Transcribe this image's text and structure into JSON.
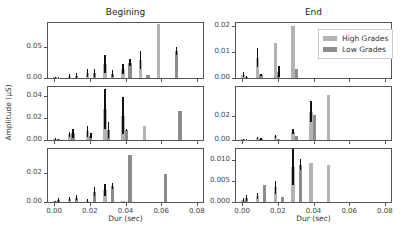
{
  "chart_data": {
    "type": "bar",
    "layout": "3x2 grid of subplots, shared x-axis",
    "column_titles": [
      "Begining",
      "End"
    ],
    "xlabel": "Dur (sec)",
    "ylabel": "Amplitude (µS)",
    "xticks": [
      "0.00",
      "0.02",
      "0.04",
      "0.06",
      "0.08"
    ],
    "xlim": [
      -0.004,
      0.084
    ],
    "legend": {
      "entries": [
        "High Grades",
        "Low Grades"
      ],
      "position": "upper right of top-right panel"
    },
    "colors": {
      "High Grades": "#b3b3b3",
      "Low Grades": "#8c8c8c",
      "error": "#111111"
    },
    "panels": [
      {
        "row": 0,
        "col": 0,
        "ylim": [
          0,
          0.09
        ],
        "yticks": [
          "0.00",
          "0.05"
        ],
        "ytick_values": [
          0,
          0.05
        ],
        "bars": [
          {
            "x": 0.0,
            "series": "High Grades",
            "y": 0.001,
            "err": 0.001
          },
          {
            "x": 0.002,
            "series": "Low Grades",
            "y": 0.0005,
            "err": 0.001
          },
          {
            "x": 0.008,
            "series": "High Grades",
            "y": 0.003,
            "err": 0.004
          },
          {
            "x": 0.012,
            "series": "Low Grades",
            "y": 0.004,
            "err": 0.004
          },
          {
            "x": 0.018,
            "series": "High Grades",
            "y": 0.008,
            "err": 0.007
          },
          {
            "x": 0.022,
            "series": "Low Grades",
            "y": 0.008,
            "err": 0.006
          },
          {
            "x": 0.028,
            "series": "High Grades",
            "y": 0.023,
            "err": 0.014
          },
          {
            "x": 0.032,
            "series": "Low Grades",
            "y": 0.007,
            "err": 0.006
          },
          {
            "x": 0.038,
            "series": "High Grades",
            "y": 0.015,
            "err": 0.008
          },
          {
            "x": 0.042,
            "series": "Low Grades",
            "y": 0.025,
            "err": 0.006
          },
          {
            "x": 0.048,
            "series": "High Grades",
            "y": 0.03,
            "err": 0.015
          },
          {
            "x": 0.052,
            "series": "Low Grades",
            "y": 0.005,
            "err": 0
          },
          {
            "x": 0.058,
            "series": "High Grades",
            "y": 0.088,
            "err": 0
          },
          {
            "x": 0.068,
            "series": "Low Grades",
            "y": 0.044,
            "err": 0.006
          }
        ]
      },
      {
        "row": 0,
        "col": 1,
        "ylim": [
          0,
          0.021
        ],
        "yticks": [
          "0.00",
          "0.01",
          "0.02"
        ],
        "ytick_values": [
          0,
          0.01,
          0.02
        ],
        "bars": [
          {
            "x": 0.0,
            "series": "High Grades",
            "y": 0.0012,
            "err": 0.001
          },
          {
            "x": 0.002,
            "series": "Low Grades",
            "y": 0.0004,
            "err": 0.0003
          },
          {
            "x": 0.008,
            "series": "High Grades",
            "y": 0.0078,
            "err": 0.0037
          },
          {
            "x": 0.01,
            "series": "Low Grades",
            "y": 0.0011,
            "err": 0.0004
          },
          {
            "x": 0.018,
            "series": "High Grades",
            "y": 0.0135,
            "err": 0
          },
          {
            "x": 0.02,
            "series": "Low Grades",
            "y": 0.0024,
            "err": 0.002
          },
          {
            "x": 0.028,
            "series": "High Grades",
            "y": 0.02,
            "err": 0
          },
          {
            "x": 0.03,
            "series": "Low Grades",
            "y": 0.0033,
            "err": 0
          }
        ]
      },
      {
        "row": 1,
        "col": 0,
        "ylim": [
          0,
          0.048
        ],
        "yticks": [
          "0.00",
          "0.02",
          "0.04"
        ],
        "ytick_values": [
          0,
          0.02,
          0.04
        ],
        "bars": [
          {
            "x": 0.0,
            "series": "High Grades",
            "y": 0.001,
            "err": 0.001
          },
          {
            "x": 0.002,
            "series": "Low Grades",
            "y": 0.0005,
            "err": 0.0005
          },
          {
            "x": 0.008,
            "series": "High Grades",
            "y": 0.005,
            "err": 0.002
          },
          {
            "x": 0.01,
            "series": "Low Grades",
            "y": 0.006,
            "err": 0.004
          },
          {
            "x": 0.018,
            "series": "High Grades",
            "y": 0.008,
            "err": 0.005
          },
          {
            "x": 0.02,
            "series": "Low Grades",
            "y": 0.004,
            "err": 0.002
          },
          {
            "x": 0.028,
            "series": "High Grades",
            "y": 0.028,
            "err": 0.018
          },
          {
            "x": 0.03,
            "series": "Low Grades",
            "y": 0.009,
            "err": 0.007
          },
          {
            "x": 0.038,
            "series": "High Grades",
            "y": 0.022,
            "err": 0.017
          },
          {
            "x": 0.04,
            "series": "Low Grades",
            "y": 0.009,
            "err": 0.001
          },
          {
            "x": 0.05,
            "series": "High Grades",
            "y": 0.013,
            "err": 0
          },
          {
            "x": 0.07,
            "series": "Low Grades",
            "y": 0.026,
            "err": 0
          }
        ]
      },
      {
        "row": 1,
        "col": 1,
        "ylim": [
          0,
          0.045
        ],
        "yticks": [
          "0.00",
          "0.02"
        ],
        "ytick_values": [
          0,
          0.02
        ],
        "bars": [
          {
            "x": 0.0,
            "series": "High Grades",
            "y": 0.0005,
            "err": 0.0005
          },
          {
            "x": 0.002,
            "series": "Low Grades",
            "y": 0.0003,
            "err": 0.0003
          },
          {
            "x": 0.008,
            "series": "High Grades",
            "y": 0.0015,
            "err": 0.001
          },
          {
            "x": 0.01,
            "series": "Low Grades",
            "y": 0.0012,
            "err": 0.0008
          },
          {
            "x": 0.018,
            "series": "High Grades",
            "y": 0.003,
            "err": 0.0015
          },
          {
            "x": 0.02,
            "series": "Low Grades",
            "y": 0.001,
            "err": 0
          },
          {
            "x": 0.028,
            "series": "High Grades",
            "y": 0.007,
            "err": 0.002
          },
          {
            "x": 0.03,
            "series": "Low Grades",
            "y": 0.0035,
            "err": 0
          },
          {
            "x": 0.038,
            "series": "High Grades",
            "y": 0.024,
            "err": 0.009
          },
          {
            "x": 0.04,
            "series": "Low Grades",
            "y": 0.021,
            "err": 0
          },
          {
            "x": 0.048,
            "series": "High Grades",
            "y": 0.038,
            "err": 0
          }
        ]
      },
      {
        "row": 2,
        "col": 0,
        "ylim": [
          0,
          0.036
        ],
        "yticks": [
          "0.00",
          "0.02"
        ],
        "ytick_values": [
          0,
          0.02
        ],
        "bars": [
          {
            "x": 0.0,
            "series": "High Grades",
            "y": 0.0005,
            "err": 0.0005
          },
          {
            "x": 0.002,
            "series": "Low Grades",
            "y": 0.0015,
            "err": 0.0015
          },
          {
            "x": 0.008,
            "series": "High Grades",
            "y": 0.002,
            "err": 0.0012
          },
          {
            "x": 0.012,
            "series": "Low Grades",
            "y": 0.003,
            "err": 0.0015
          },
          {
            "x": 0.018,
            "series": "High Grades",
            "y": 0.001,
            "err": 0.001
          },
          {
            "x": 0.022,
            "series": "Low Grades",
            "y": 0.007,
            "err": 0.003
          },
          {
            "x": 0.028,
            "series": "High Grades",
            "y": 0.008,
            "err": 0.004
          },
          {
            "x": 0.032,
            "series": "Low Grades",
            "y": 0.011,
            "err": 0.002
          },
          {
            "x": 0.038,
            "series": "High Grades",
            "y": 0.001,
            "err": 0
          },
          {
            "x": 0.042,
            "series": "Low Grades",
            "y": 0.032,
            "err": 0
          },
          {
            "x": 0.062,
            "series": "Low Grades",
            "y": 0.019,
            "err": 0
          }
        ]
      },
      {
        "row": 2,
        "col": 1,
        "ylim": [
          0,
          0.0125
        ],
        "yticks": [
          "0.000",
          "0.005",
          "0.010"
        ],
        "ytick_values": [
          0,
          0.005,
          0.01
        ],
        "bars": [
          {
            "x": 0.0,
            "series": "High Grades",
            "y": 0.0005,
            "err": 0.0004
          },
          {
            "x": 0.002,
            "series": "Low Grades",
            "y": 0.001,
            "err": 0.0007
          },
          {
            "x": 0.008,
            "series": "High Grades",
            "y": 0.0015,
            "err": 0.0007
          },
          {
            "x": 0.012,
            "series": "Low Grades",
            "y": 0.0039,
            "err": 0
          },
          {
            "x": 0.018,
            "series": "High Grades",
            "y": 0.0035,
            "err": 0.0015
          },
          {
            "x": 0.022,
            "series": "Low Grades",
            "y": 0.0013,
            "err": 0
          },
          {
            "x": 0.028,
            "series": "High Grades",
            "y": 0.0083,
            "err": 0.0042
          },
          {
            "x": 0.032,
            "series": "Low Grades",
            "y": 0.0088,
            "err": 0.0013
          },
          {
            "x": 0.038,
            "series": "High Grades",
            "y": 0.0093,
            "err": 0
          },
          {
            "x": 0.048,
            "series": "High Grades",
            "y": 0.0088,
            "err": 0
          }
        ]
      }
    ]
  }
}
